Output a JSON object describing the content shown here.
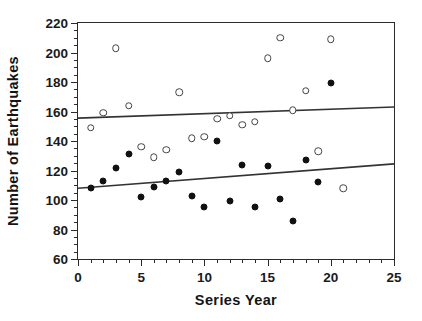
{
  "chart_data": {
    "type": "scatter",
    "title": "",
    "xlabel": "Series Year",
    "ylabel": "Number of Earthquakes",
    "xlim": [
      0,
      25
    ],
    "ylim": [
      60,
      220
    ],
    "xticks": [
      0,
      5,
      10,
      15,
      20,
      25
    ],
    "yticks": [
      60,
      80,
      100,
      120,
      140,
      160,
      180,
      200,
      220
    ],
    "xtick_labels": [
      "0",
      "5",
      "10",
      "15",
      "20",
      "25"
    ],
    "ytick_labels": [
      "60",
      "80",
      "100",
      "120",
      "140",
      "160",
      "180",
      "200",
      "220"
    ],
    "x_minor_step": 1,
    "y_minor_step": 5,
    "grid": false,
    "legend": "none",
    "series": [
      {
        "name": "open-circles",
        "marker": "open-circle",
        "color": "#444444",
        "points": [
          {
            "x": 1,
            "y": 149
          },
          {
            "x": 2,
            "y": 159
          },
          {
            "x": 3,
            "y": 203
          },
          {
            "x": 4,
            "y": 164
          },
          {
            "x": 5,
            "y": 136
          },
          {
            "x": 6,
            "y": 129
          },
          {
            "x": 7,
            "y": 134
          },
          {
            "x": 8,
            "y": 173
          },
          {
            "x": 9,
            "y": 142
          },
          {
            "x": 10,
            "y": 143
          },
          {
            "x": 11,
            "y": 155
          },
          {
            "x": 12,
            "y": 157
          },
          {
            "x": 13,
            "y": 151
          },
          {
            "x": 14,
            "y": 153
          },
          {
            "x": 15,
            "y": 196
          },
          {
            "x": 16,
            "y": 210
          },
          {
            "x": 17,
            "y": 161
          },
          {
            "x": 18,
            "y": 174
          },
          {
            "x": 19,
            "y": 133
          },
          {
            "x": 20,
            "y": 209
          },
          {
            "x": 21,
            "y": 108
          }
        ]
      },
      {
        "name": "filled-circles",
        "marker": "filled-circle",
        "color": "#111111",
        "points": [
          {
            "x": 1,
            "y": 108
          },
          {
            "x": 2,
            "y": 113
          },
          {
            "x": 3,
            "y": 122
          },
          {
            "x": 4,
            "y": 131
          },
          {
            "x": 5,
            "y": 102
          },
          {
            "x": 6,
            "y": 109
          },
          {
            "x": 7,
            "y": 113
          },
          {
            "x": 8,
            "y": 119
          },
          {
            "x": 9,
            "y": 103
          },
          {
            "x": 10,
            "y": 95
          },
          {
            "x": 11,
            "y": 140
          },
          {
            "x": 12,
            "y": 99
          },
          {
            "x": 13,
            "y": 124
          },
          {
            "x": 14,
            "y": 95
          },
          {
            "x": 15,
            "y": 123
          },
          {
            "x": 16,
            "y": 101
          },
          {
            "x": 17,
            "y": 86
          },
          {
            "x": 18,
            "y": 127
          },
          {
            "x": 19,
            "y": 112
          },
          {
            "x": 20,
            "y": 179
          }
        ]
      }
    ],
    "trend_lines": [
      {
        "name": "upper-trend-line",
        "x0": 0,
        "y0": 155.5,
        "x1": 25,
        "y1": 163.0,
        "color": "#333333"
      },
      {
        "name": "lower-trend-line",
        "x0": 0,
        "y0": 108.0,
        "x1": 25,
        "y1": 124.5,
        "color": "#333333"
      }
    ]
  }
}
